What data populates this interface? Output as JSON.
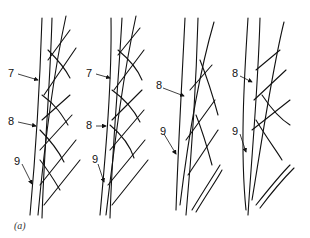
{
  "figure": {
    "caption": "(a)",
    "panels": [
      {
        "id": 1,
        "labels": [
          "7",
          "8",
          "9"
        ]
      },
      {
        "id": 2,
        "labels": [
          "7",
          "8",
          "9"
        ]
      },
      {
        "id": 3,
        "labels": [
          "8",
          "9"
        ]
      },
      {
        "id": 4,
        "labels": [
          "8",
          "9"
        ]
      }
    ]
  },
  "colors": {
    "ink": "#111111",
    "background": "#ffffff"
  }
}
